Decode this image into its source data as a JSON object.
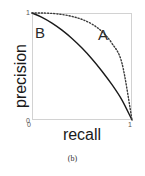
{
  "figure": {
    "caption": "(b)",
    "background_color": "#ffffff"
  },
  "chart_data": {
    "type": "line",
    "title": "",
    "subtitle": "",
    "xlabel": "recall",
    "ylabel": "precision",
    "xlim": [
      0,
      1
    ],
    "ylim": [
      0,
      1
    ],
    "xticks": [
      "0",
      "1"
    ],
    "yticks": [
      "0",
      "1"
    ],
    "grid": false,
    "legend": "none",
    "frame_color": "#d2d2d2",
    "annotations": [
      {
        "text": "B",
        "x": 0.04,
        "y": 0.88,
        "series": "B"
      },
      {
        "text": "A",
        "x": 0.66,
        "y": 0.86,
        "series": "A"
      }
    ],
    "series": [
      {
        "name": "B",
        "style": "solid",
        "color": "#1a1a1a",
        "width": 1.4,
        "x": [
          0.0,
          0.1,
          0.2,
          0.3,
          0.4,
          0.5,
          0.6,
          0.7,
          0.8,
          0.9,
          1.0
        ],
        "y": [
          1.0,
          0.96,
          0.906,
          0.84,
          0.762,
          0.672,
          0.57,
          0.456,
          0.33,
          0.186,
          0.0
        ]
      },
      {
        "name": "A",
        "style": "dotted",
        "color": "#3a3a3a",
        "width": 1.4,
        "x": [
          0.0,
          0.1,
          0.2,
          0.3,
          0.4,
          0.5,
          0.6,
          0.7,
          0.8,
          0.9,
          1.0
        ],
        "y": [
          1.0,
          1.0,
          0.996,
          0.986,
          0.968,
          0.94,
          0.896,
          0.826,
          0.716,
          0.53,
          0.0
        ]
      }
    ]
  }
}
